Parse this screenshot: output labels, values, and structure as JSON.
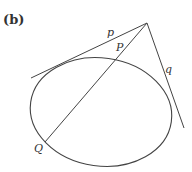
{
  "figure": {
    "panel_label": "(b)",
    "labels": {
      "tangent_p": "p",
      "tangent_q": "q",
      "point_P": "P",
      "point_Q": "Q"
    },
    "colors": {
      "stroke": "#444444",
      "text": "#333333",
      "background": "#ffffff"
    },
    "elements": {
      "ellipse": {
        "cx": 101,
        "cy": 112,
        "rx": 71,
        "ry": 54,
        "rotation": 8
      },
      "apex": {
        "x": 147,
        "y": 23
      },
      "tangent_p_line": {
        "x1": 31,
        "y1": 78,
        "x2": 147,
        "y2": 23
      },
      "tangent_q_line": {
        "x1": 147,
        "y1": 23,
        "x2": 184,
        "y2": 128
      },
      "secant_line": {
        "x1": 147,
        "y1": 23,
        "x2": 45,
        "y2": 142
      }
    }
  }
}
